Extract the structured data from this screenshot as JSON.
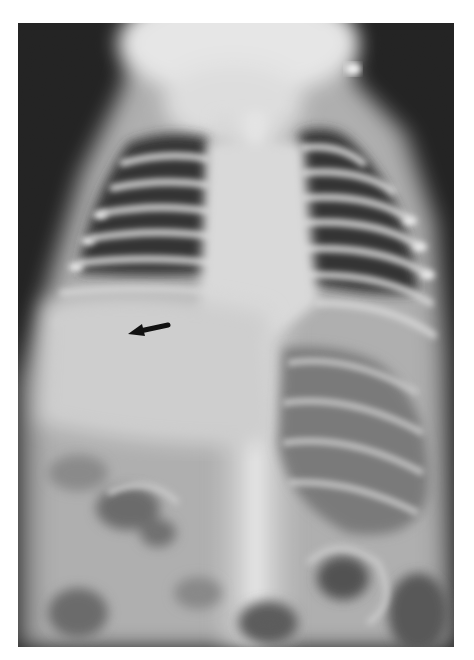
{
  "image": {
    "kind": "radiograph",
    "view": "frontal chest and abdomen",
    "modality": "x-ray",
    "grayscale": true,
    "frame": {
      "x": 18,
      "y": 23,
      "width": 436,
      "height": 624
    },
    "background_color": "#ffffff"
  },
  "annotations": [
    {
      "type": "arrow",
      "direction": "left",
      "color": "#111111",
      "tail": [
        168,
        325
      ],
      "head": [
        128,
        333
      ]
    }
  ]
}
